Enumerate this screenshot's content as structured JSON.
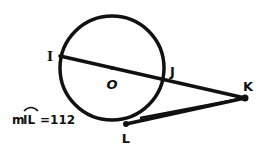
{
  "diagram": {
    "type": "circle-secant-tangent",
    "stroke_color": "#111111",
    "background": "#ffffff",
    "circle": {
      "center_label": "O",
      "cx": 112,
      "cy": 68,
      "r": 52
    },
    "points": {
      "I": {
        "label": "I",
        "x": 60,
        "y": 56
      },
      "O": {
        "label": "O",
        "x": 112,
        "y": 68
      },
      "J": {
        "label": "J",
        "x": 164,
        "y": 80
      },
      "K": {
        "label": "K",
        "x": 245,
        "y": 98
      },
      "L": {
        "label": "L",
        "x": 126,
        "y": 124
      }
    },
    "segments": [
      "IK (secant through O)",
      "LK (tangent)"
    ],
    "annotation": {
      "prefix": "m",
      "arc": "IL",
      "equals": "=112",
      "text": "mIL=112"
    }
  }
}
